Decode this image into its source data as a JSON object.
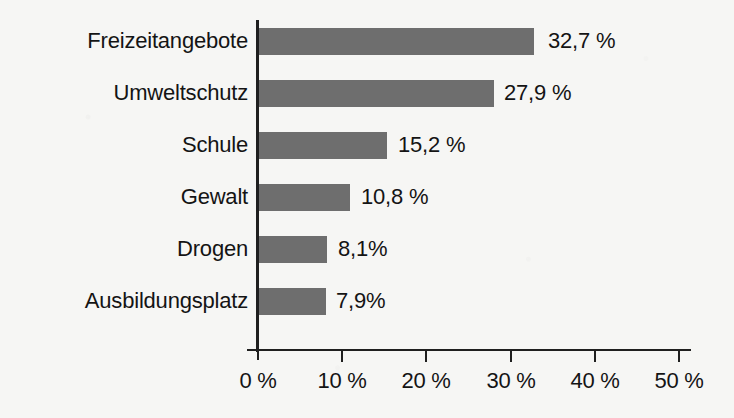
{
  "chart_data": {
    "type": "bar",
    "orientation": "horizontal",
    "title": "",
    "subtitle": "",
    "xlabel": "",
    "ylabel": "",
    "categories": [
      "Freizeitangebote",
      "Umweltschutz",
      "Schule",
      "Gewalt",
      "Drogen",
      "Ausbildungsplatz"
    ],
    "values": [
      32.7,
      27.9,
      15.2,
      10.8,
      8.1,
      7.9
    ],
    "value_labels": [
      "32,7 %",
      "27,9 %",
      "15,2 %",
      "10,8 %",
      "8,1%",
      "7,9%"
    ],
    "xlim": [
      0,
      50
    ],
    "x_ticks": [
      0,
      10,
      20,
      30,
      40,
      50
    ],
    "x_tick_labels": [
      "0 %",
      "10 %",
      "20 %",
      "30 %",
      "40 %",
      "50 %"
    ],
    "grid": false,
    "legend": false,
    "bar_color": "#6e6e6e",
    "axis_color": "#1f1f1f",
    "background_color": "#f6f6f4",
    "text_color": "#141414"
  }
}
